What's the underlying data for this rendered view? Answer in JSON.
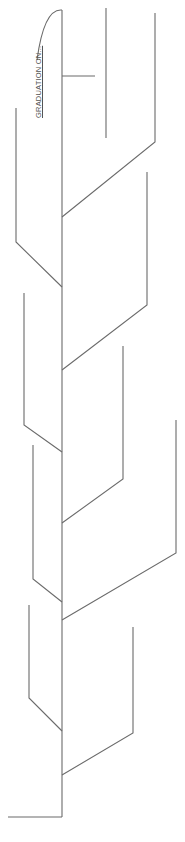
{
  "diagram": {
    "type": "fishbone",
    "orientation": "vertical",
    "effect_label": "GRADUATION ON...",
    "colors": {
      "line": "#6b6b6b",
      "text": "#555555",
      "background": "#ffffff"
    },
    "spine": {
      "x": 62,
      "y_top": 10,
      "y_bottom": 817
    },
    "bones": {
      "right": [
        {
          "id": "r1",
          "x": 155,
          "y_top": 13,
          "y_end": 142,
          "join_y": 217
        },
        {
          "id": "r2",
          "x": 147,
          "y_top": 172,
          "y_end": 305,
          "join_y": 370
        },
        {
          "id": "r3",
          "x": 123,
          "y_top": 346,
          "y_end": 479,
          "join_y": 523
        },
        {
          "id": "r4",
          "x": 176,
          "y_top": 420,
          "y_end": 553,
          "join_y": 620
        },
        {
          "id": "r5",
          "x": 133,
          "y_top": 627,
          "y_end": 733,
          "join_y": 775
        }
      ],
      "left": [
        {
          "id": "l1",
          "x": 16,
          "y_top": 108,
          "y_end": 242,
          "join_y": 287
        },
        {
          "id": "l2",
          "x": 24,
          "y_top": 293,
          "y_end": 425,
          "join_y": 452
        },
        {
          "id": "l3",
          "x": 33,
          "y_top": 445,
          "y_end": 579,
          "join_y": 602
        },
        {
          "id": "l4",
          "x": 29,
          "y_top": 605,
          "y_end": 698,
          "join_y": 731
        }
      ]
    }
  }
}
